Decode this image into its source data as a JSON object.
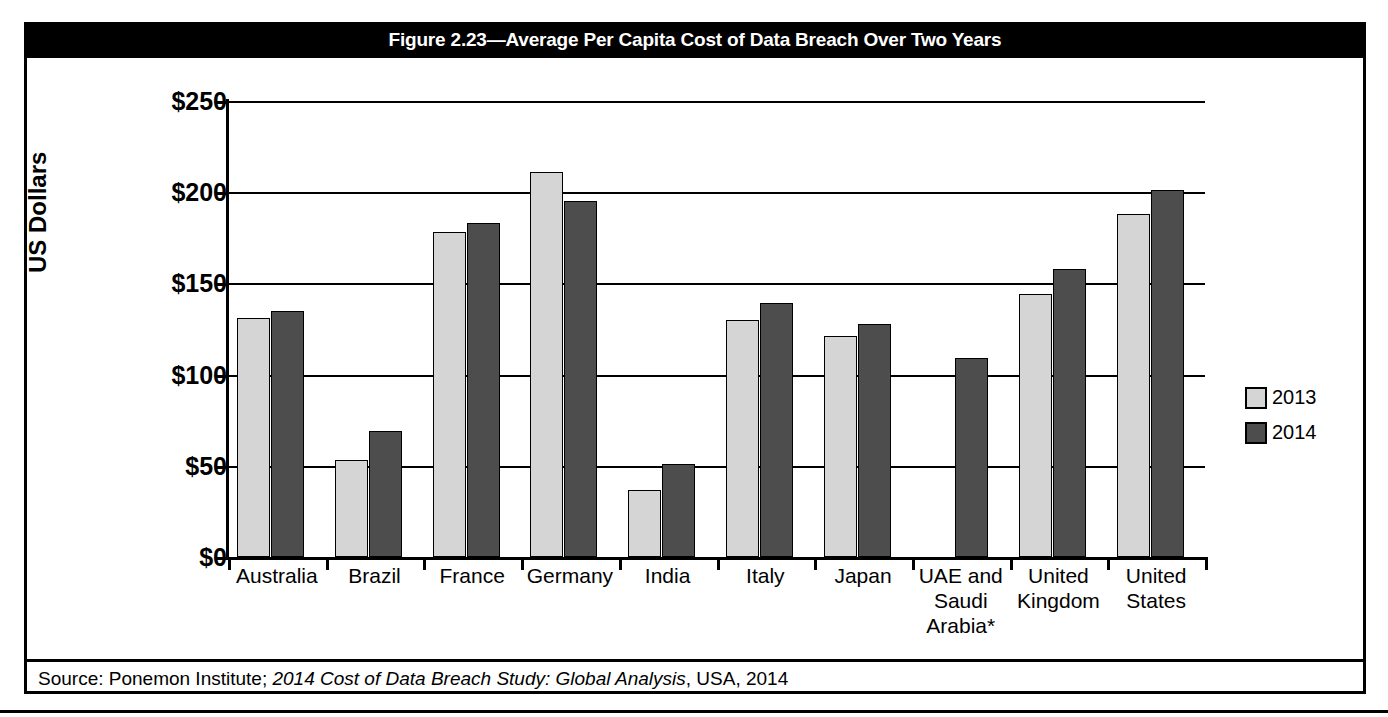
{
  "figure": {
    "title": "Figure 2.23—Average Per Capita Cost of Data Breach Over Two Years",
    "footnote": "* No data available for 2013",
    "source_prefix": "Source:  Ponemon Institute; ",
    "source_italic": "2014 Cost of Data Breach Study: Global Analysis",
    "source_suffix": ", USA, 2014"
  },
  "legend": {
    "items": [
      {
        "label": "2013",
        "color": "#d5d5d5"
      },
      {
        "label": "2014",
        "color": "#4d4d4d"
      }
    ]
  },
  "chart_data": {
    "type": "bar",
    "title": "Figure 2.23—Average Per Capita Cost of Data Breach Over Two Years",
    "xlabel": "",
    "ylabel": "US Dollars",
    "ylim": [
      0,
      250
    ],
    "ytick_values": [
      0,
      50,
      100,
      150,
      200,
      250
    ],
    "ytick_labels": [
      "$0",
      "$50",
      "$100",
      "$150",
      "$200",
      "$250"
    ],
    "grid": true,
    "legend_position": "right",
    "categories": [
      "Australia",
      "Brazil",
      "France",
      "Germany",
      "India",
      "Italy",
      "Japan",
      "UAE and Saudi Arabia*",
      "United Kingdom",
      "United States"
    ],
    "category_lines": [
      [
        "Australia"
      ],
      [
        "Brazil"
      ],
      [
        "France"
      ],
      [
        "Germany"
      ],
      [
        "India"
      ],
      [
        "Italy"
      ],
      [
        "Japan"
      ],
      [
        "UAE and",
        "Saudi",
        "Arabia*"
      ],
      [
        "United",
        "Kingdom"
      ],
      [
        "United",
        "States"
      ]
    ],
    "series": [
      {
        "name": "2013",
        "color": "#d5d5d5",
        "values": [
          131,
          53,
          178,
          211,
          37,
          130,
          121,
          null,
          144,
          188
        ]
      },
      {
        "name": "2014",
        "color": "#4d4d4d",
        "values": [
          135,
          69,
          183,
          195,
          51,
          139,
          128,
          109,
          158,
          201
        ]
      }
    ],
    "annotations": [
      "* No data available for 2013"
    ]
  }
}
